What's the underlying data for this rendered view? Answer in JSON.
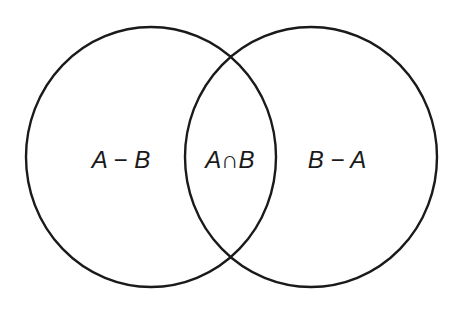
{
  "diagram": {
    "type": "venn",
    "stroke_color": "#1a1a1a",
    "background": "#ffffff",
    "sets": [
      {
        "name": "A",
        "cx": 151,
        "cy": 157,
        "rx": 125,
        "ry": 130
      },
      {
        "name": "B",
        "cx": 311,
        "cy": 157,
        "rx": 126,
        "ry": 130
      }
    ],
    "regions": [
      {
        "id": "a-minus-b",
        "label": "A − B",
        "x": 121,
        "y": 168
      },
      {
        "id": "a-intersect-b",
        "label": "A∩B",
        "x": 230,
        "y": 168
      },
      {
        "id": "b-minus-a",
        "label": "B − A",
        "x": 337,
        "y": 168
      }
    ]
  }
}
